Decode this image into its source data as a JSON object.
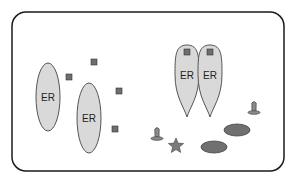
{
  "diagram": {
    "colors": {
      "background": "#ffffff",
      "border": "#1a1a1a",
      "er_fill": "#d9d9d9",
      "er_stroke": "#555555",
      "square_fill": "#6e6e6e",
      "dark_ellipse_fill": "#707070",
      "cone_fill": "#8a8a8a",
      "star_fill": "#7a7a7a"
    },
    "compartment": {
      "x": 12,
      "y": 12,
      "width": 272,
      "height": 159,
      "radius": 14
    },
    "er_ellipses": [
      {
        "label": "ER",
        "cx": 48,
        "cy": 97,
        "rx": 12,
        "ry": 34
      },
      {
        "label": "ER",
        "cx": 89,
        "cy": 118,
        "rx": 12,
        "ry": 35
      }
    ],
    "squares": [
      {
        "x": 66,
        "y": 74,
        "size": 6
      },
      {
        "x": 91,
        "y": 59,
        "size": 6
      },
      {
        "x": 116,
        "y": 88,
        "size": 6
      },
      {
        "x": 112,
        "y": 126,
        "size": 6
      }
    ],
    "budding_ers": [
      {
        "label": "ER",
        "cx": 187,
        "top": 45,
        "bottom": 117,
        "width": 24,
        "square": {
          "x": 184,
          "y": 49,
          "size": 6
        }
      },
      {
        "label": "ER",
        "cx": 210,
        "top": 45,
        "bottom": 117,
        "width": 24,
        "square": {
          "x": 207,
          "y": 49,
          "size": 6
        }
      }
    ],
    "cones": [
      {
        "cx": 157,
        "base_y": 140
      },
      {
        "cx": 254,
        "base_y": 114
      }
    ],
    "stars": [
      {
        "cx": 176,
        "cy": 146,
        "r": 8
      }
    ],
    "dark_ellipses": [
      {
        "cx": 237,
        "cy": 130,
        "rx": 13,
        "ry": 6
      },
      {
        "cx": 214,
        "cy": 147,
        "rx": 13,
        "ry": 6
      }
    ]
  }
}
